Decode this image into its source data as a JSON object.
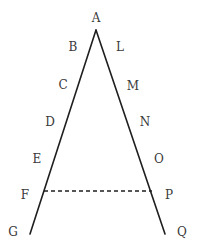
{
  "diagram": {
    "stroke_color": "#1f1f1f",
    "label_color": "#3a3a3a",
    "apex": {
      "label": "A",
      "x": 96,
      "y": 30,
      "label_x": 96,
      "label_y": 18
    },
    "left_side": {
      "end": {
        "x": 30,
        "y": 234
      },
      "points": [
        {
          "label": "B",
          "x": 73,
          "y": 47
        },
        {
          "label": "C",
          "x": 63,
          "y": 85
        },
        {
          "label": "D",
          "x": 50,
          "y": 122
        },
        {
          "label": "E",
          "x": 37,
          "y": 159
        },
        {
          "label": "F",
          "x": 25,
          "y": 195
        },
        {
          "label": "G",
          "x": 13,
          "y": 232
        }
      ]
    },
    "right_side": {
      "end": {
        "x": 165,
        "y": 234
      },
      "points": [
        {
          "label": "L",
          "x": 120,
          "y": 47
        },
        {
          "label": "M",
          "x": 133,
          "y": 86
        },
        {
          "label": "N",
          "x": 145,
          "y": 122
        },
        {
          "label": "O",
          "x": 159,
          "y": 159
        },
        {
          "label": "P",
          "x": 169,
          "y": 195
        },
        {
          "label": "Q",
          "x": 182,
          "y": 232
        }
      ]
    },
    "dashed_segment": {
      "from_label": "F",
      "to_label": "P",
      "x1": 44,
      "y1": 191,
      "x2": 152,
      "y2": 191
    }
  }
}
